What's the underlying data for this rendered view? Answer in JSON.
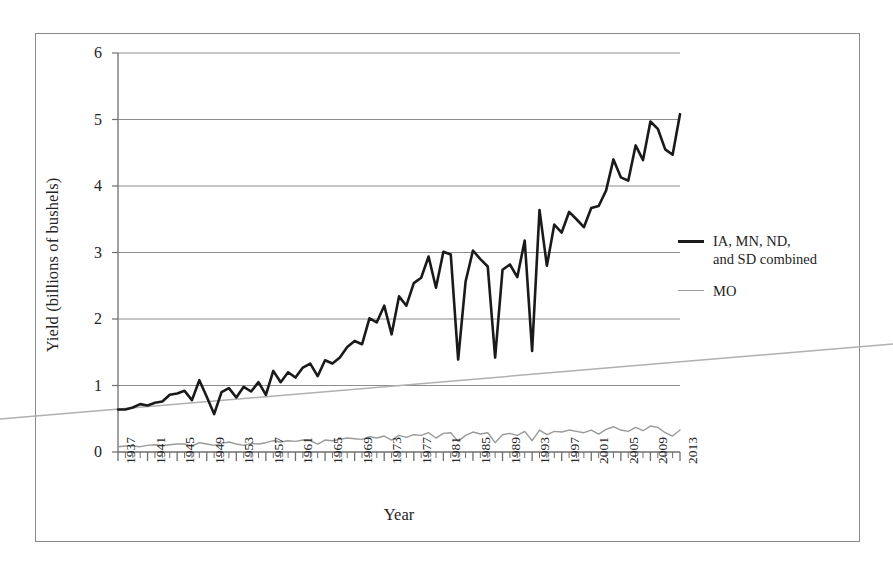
{
  "chart_data": {
    "type": "line",
    "title": "",
    "xlabel": "Year",
    "ylabel": "Yield (billions of bushels)",
    "ylim": [
      0,
      6
    ],
    "yticks": [
      0,
      1,
      2,
      3,
      4,
      5,
      6
    ],
    "xlim": [
      1937,
      2013
    ],
    "xticks": [
      1937,
      1941,
      1945,
      1949,
      1953,
      1957,
      1961,
      1965,
      1969,
      1973,
      1977,
      1981,
      1985,
      1989,
      1993,
      1997,
      2001,
      2005,
      2009,
      2013
    ],
    "grid": "horizontal",
    "legend_position": "right",
    "x": [
      1937,
      1938,
      1939,
      1940,
      1941,
      1942,
      1943,
      1944,
      1945,
      1946,
      1947,
      1948,
      1949,
      1950,
      1951,
      1952,
      1953,
      1954,
      1955,
      1956,
      1957,
      1958,
      1959,
      1960,
      1961,
      1962,
      1963,
      1964,
      1965,
      1966,
      1967,
      1968,
      1969,
      1970,
      1971,
      1972,
      1973,
      1974,
      1975,
      1976,
      1977,
      1978,
      1979,
      1980,
      1981,
      1982,
      1983,
      1984,
      1985,
      1986,
      1987,
      1988,
      1989,
      1990,
      1991,
      1992,
      1993,
      1994,
      1995,
      1996,
      1997,
      1998,
      1999,
      2000,
      2001,
      2002,
      2003,
      2004,
      2005,
      2006,
      2007,
      2008,
      2009,
      2010,
      2011,
      2012,
      2013
    ],
    "series": [
      {
        "name": "IA, MN, ND, and SD combined",
        "color": "#1a1a1a",
        "width": 2.6,
        "values": [
          0.64,
          0.64,
          0.67,
          0.72,
          0.7,
          0.74,
          0.76,
          0.86,
          0.88,
          0.92,
          0.78,
          1.08,
          0.83,
          0.57,
          0.9,
          0.96,
          0.82,
          0.98,
          0.91,
          1.05,
          0.86,
          1.22,
          1.05,
          1.2,
          1.12,
          1.27,
          1.33,
          1.14,
          1.38,
          1.33,
          1.42,
          1.58,
          1.67,
          1.62,
          2.01,
          1.95,
          2.2,
          1.77,
          2.34,
          2.2,
          2.54,
          2.62,
          2.94,
          2.47,
          3.01,
          2.97,
          1.39,
          2.56,
          3.03,
          2.9,
          2.79,
          1.42,
          2.74,
          2.82,
          2.63,
          3.18,
          1.52,
          3.64,
          2.8,
          3.42,
          3.3,
          3.61,
          3.5,
          3.38,
          3.67,
          3.7,
          3.93,
          4.4,
          4.13,
          4.08,
          4.61,
          4.39,
          4.97,
          4.86,
          4.55,
          4.47,
          5.08
        ]
      },
      {
        "name": "MO",
        "color": "#9a9a9a",
        "width": 1.4,
        "values": [
          0.08,
          0.09,
          0.09,
          0.08,
          0.1,
          0.11,
          0.1,
          0.11,
          0.12,
          0.12,
          0.09,
          0.14,
          0.12,
          0.1,
          0.13,
          0.15,
          0.12,
          0.1,
          0.13,
          0.12,
          0.14,
          0.17,
          0.15,
          0.17,
          0.16,
          0.18,
          0.17,
          0.12,
          0.18,
          0.17,
          0.19,
          0.21,
          0.2,
          0.19,
          0.23,
          0.21,
          0.24,
          0.18,
          0.25,
          0.22,
          0.26,
          0.25,
          0.29,
          0.21,
          0.28,
          0.29,
          0.16,
          0.25,
          0.3,
          0.27,
          0.29,
          0.14,
          0.26,
          0.28,
          0.25,
          0.31,
          0.17,
          0.33,
          0.26,
          0.31,
          0.3,
          0.33,
          0.31,
          0.29,
          0.33,
          0.27,
          0.34,
          0.38,
          0.33,
          0.31,
          0.37,
          0.32,
          0.39,
          0.37,
          0.29,
          0.24,
          0.33
        ]
      }
    ],
    "annotations": [
      {
        "name": "scan-artifact-line",
        "description": "faint diagonal line crossing the figure"
      }
    ]
  },
  "legend": {
    "items": [
      {
        "label_line1": "IA, MN, ND,",
        "label_line2": "and SD combined"
      },
      {
        "label_line1": "MO",
        "label_line2": ""
      }
    ]
  },
  "axes": {
    "y_title": "Yield (billions of bushels)",
    "x_title": "Year"
  }
}
